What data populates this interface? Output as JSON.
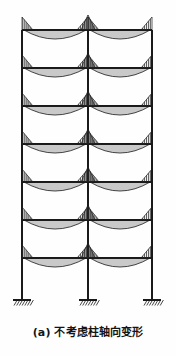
{
  "figure": {
    "caption": "(a) 不考虑柱轴向变形",
    "caption_label": "(a)",
    "caption_text": "不考虑柱轴向变形",
    "diagram_type": "bending-moment-diagram",
    "structure": "7-story 2-bay rigid frame",
    "support_type": "fixed",
    "colors": {
      "line": "#1a1a1a",
      "hatch": "#2b2b2b",
      "background": "#fefefe",
      "caption": "#141414"
    }
  },
  "chart_data": {
    "type": "line",
    "title": "不考虑柱轴向变形",
    "xlabel": "",
    "ylabel": "",
    "grid": false,
    "legend": null,
    "geometry": {
      "column_x": [
        22,
        88,
        152
      ],
      "column_labels": [
        "左柱",
        "中柱",
        "右柱"
      ],
      "beam_y": [
        30,
        68,
        106,
        144,
        182,
        220,
        258
      ],
      "story_labels": [
        "7层",
        "6层",
        "5层",
        "4层",
        "3层",
        "2层",
        "1层"
      ],
      "base_y": 300,
      "bay_count": 2,
      "story_count": 7,
      "bay_spans": [
        66,
        64
      ]
    },
    "moment_profile": {
      "description": "每跨梁弯矩：两端负弯矩(梁上方阴影)，跨中正弯矩(梁下方阴影)",
      "end_moment_height": 13,
      "mid_moment_depth": 9,
      "hatch_spacing": 2,
      "hatch_direction": "vertical"
    },
    "column_moment": {
      "description": "中柱节点上下三角形弯矩",
      "triangle_height": 12,
      "triangle_half_width": 7
    },
    "series": [
      {
        "name": "梁端负弯矩 (左柱)",
        "values": [
          13,
          13,
          13,
          13,
          13,
          13,
          13
        ]
      },
      {
        "name": "梁跨中正弯矩 (左跨)",
        "values": [
          9,
          9,
          9,
          9,
          9,
          9,
          9
        ]
      },
      {
        "name": "梁端负弯矩 (中柱)",
        "values": [
          14,
          14,
          14,
          14,
          14,
          14,
          14
        ]
      },
      {
        "name": "梁跨中正弯矩 (右跨)",
        "values": [
          9,
          9,
          9,
          9,
          9,
          9,
          9
        ]
      },
      {
        "name": "梁端负弯矩 (右柱)",
        "values": [
          13,
          13,
          13,
          13,
          13,
          13,
          13
        ]
      }
    ],
    "categories": [
      "7层",
      "6层",
      "5层",
      "4层",
      "3层",
      "2层",
      "1层"
    ]
  },
  "supports": [
    {
      "name": "左柱固定支座",
      "x": 22,
      "y": 300
    },
    {
      "name": "中柱固定支座",
      "x": 88,
      "y": 300
    },
    {
      "name": "右柱固定支座",
      "x": 152,
      "y": 300
    }
  ]
}
